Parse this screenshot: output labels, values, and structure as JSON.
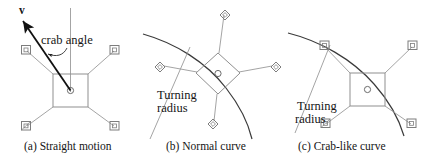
{
  "figure": {
    "type": "technical-diagram",
    "panel_count": 3
  },
  "panels": [
    {
      "id": "a",
      "caption": "(a) Straight motion",
      "chassis_shape": "square",
      "chassis_rotation_deg": 0,
      "labels": {
        "velocity": "v",
        "crab_angle": "crab angle"
      },
      "annotations": [
        "velocity-vector-arrow",
        "vertical-reference-line",
        "crab-angle-arc"
      ],
      "wheels": [
        {
          "position": "front-left",
          "marker": "square"
        },
        {
          "position": "front-right",
          "marker": "square"
        },
        {
          "position": "rear-left",
          "marker": "square"
        },
        {
          "position": "rear-right",
          "marker": "square"
        }
      ]
    },
    {
      "id": "b",
      "caption": "(b) Normal curve",
      "chassis_shape": "square",
      "chassis_rotation_deg": 45,
      "labels": {
        "turning_radius_line1": "Turning",
        "turning_radius_line2": "radius"
      },
      "annotations": [
        "turning-radius-arc",
        "turning-radius-leader-line"
      ],
      "wheels": [
        {
          "position": "top",
          "marker": "diamond"
        },
        {
          "position": "left",
          "marker": "diamond"
        },
        {
          "position": "right",
          "marker": "diamond"
        },
        {
          "position": "bottom",
          "marker": "diamond"
        }
      ]
    },
    {
      "id": "c",
      "caption": "(c) Crab-like curve",
      "chassis_shape": "square",
      "chassis_rotation_deg": 0,
      "labels": {
        "turning_radius_line1": "Turning",
        "turning_radius_line2": "radius"
      },
      "annotations": [
        "turning-radius-arc",
        "turning-radius-leader-line"
      ],
      "wheels": [
        {
          "position": "front-left",
          "marker": "square"
        },
        {
          "position": "front-right",
          "marker": "square"
        },
        {
          "position": "rear-left",
          "marker": "square"
        },
        {
          "position": "rear-right",
          "marker": "square"
        }
      ]
    }
  ],
  "colors": {
    "ink": "#1a1a1a",
    "line": "#8a8a8a",
    "arc": "#3a3a3a",
    "background": "#ffffff"
  }
}
